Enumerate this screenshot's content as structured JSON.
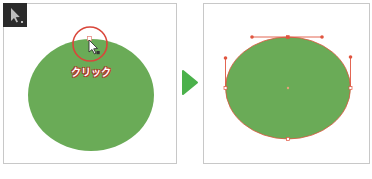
{
  "tool": {
    "icon": "direct-selection-arrow-icon",
    "background": "#2b2b2b"
  },
  "left_panel": {
    "shape": "ellipse",
    "fill": "#6aab57",
    "click_label": "クリック",
    "highlight_circle_color": "#d9463a",
    "cursor_icon": "direct-selection-cursor-icon"
  },
  "transition_arrow": {
    "icon": "right-triangle-arrow-icon",
    "color": "#4bb14b"
  },
  "right_panel": {
    "shape": "ellipse",
    "fill": "#6aab57",
    "path_color": "#e0553f",
    "anchor_points": 4,
    "visible_handles": 3
  },
  "colors": {
    "shape_green": "#6aab57",
    "highlight_red": "#d9463a",
    "handle_orange": "#e0553f",
    "arrow_green": "#4bb14b",
    "panel_border": "#c8c8c8"
  }
}
